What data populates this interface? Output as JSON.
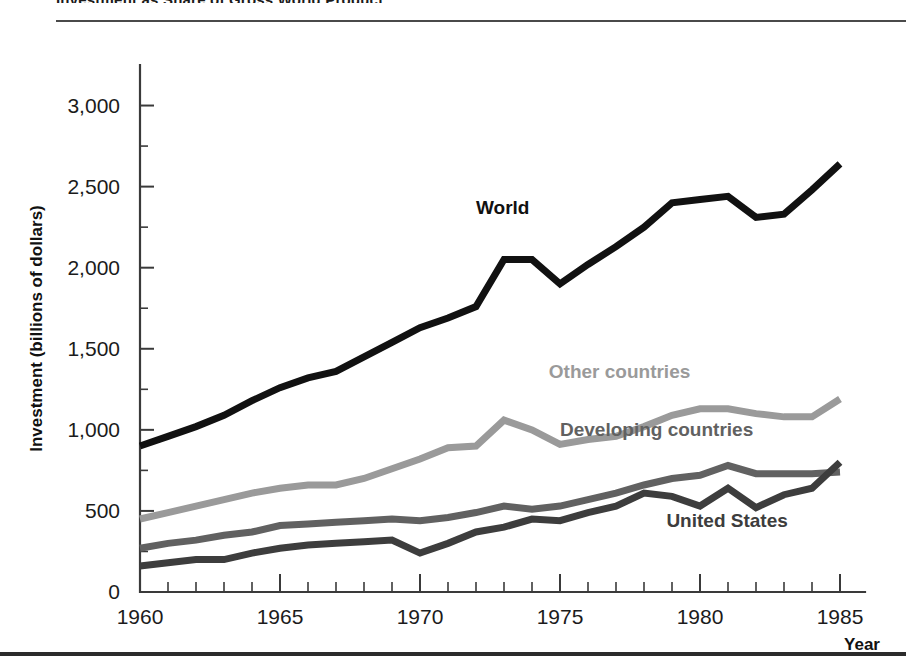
{
  "figure": {
    "title": "Investment as Share of Gross World Product",
    "top_rule": "horizontal-rule",
    "bottom_rule": "horizontal-rule"
  },
  "chart_data": {
    "type": "line",
    "title": "Investment as Share of Gross World Product",
    "xlabel": "Year",
    "ylabel": "Investment (billions of dollars)",
    "xlim": [
      1960,
      1985
    ],
    "ylim": [
      0,
      3250
    ],
    "grid": false,
    "legend_position": "inline-labels",
    "x_ticks": [
      1960,
      1965,
      1970,
      1975,
      1980,
      1985
    ],
    "x_tick_labels": [
      "1960",
      "1965",
      "1970",
      "1975",
      "1980",
      "1985"
    ],
    "x_minor_tick_step": 1,
    "y_ticks": [
      0,
      500,
      1000,
      1500,
      2000,
      2500,
      3000
    ],
    "y_tick_labels": [
      "0",
      "500",
      "1,000",
      "1,500",
      "2,000",
      "2,500",
      "3,000"
    ],
    "x": [
      1960,
      1961,
      1962,
      1963,
      1964,
      1965,
      1966,
      1967,
      1968,
      1969,
      1970,
      1971,
      1972,
      1973,
      1974,
      1975,
      1976,
      1977,
      1978,
      1979,
      1980,
      1981,
      1982,
      1983,
      1984,
      1985
    ],
    "series": [
      {
        "name": "World",
        "color": "#111111",
        "stroke_width": 7,
        "label": "World",
        "label_x": 1972.0,
        "label_y": 2330,
        "values": [
          900,
          960,
          1020,
          1090,
          1180,
          1260,
          1320,
          1360,
          1450,
          1540,
          1630,
          1690,
          1760,
          2050,
          2050,
          1900,
          2020,
          2130,
          2250,
          2400,
          2420,
          2440,
          2310,
          2330,
          2480,
          2640
        ]
      },
      {
        "name": "Other countries",
        "color": "#9a9a9a",
        "stroke_width": 7,
        "label": "Other countries",
        "label_x": 1974.6,
        "label_y": 1320,
        "values": [
          450,
          490,
          530,
          570,
          610,
          640,
          660,
          660,
          700,
          760,
          820,
          890,
          900,
          1060,
          1000,
          910,
          940,
          960,
          1020,
          1090,
          1130,
          1130,
          1100,
          1080,
          1080,
          1190
        ]
      },
      {
        "name": "Developing countries",
        "color": "#616161",
        "stroke_width": 7,
        "label": "Developing countries",
        "label_x": 1975.0,
        "label_y": 960,
        "values": [
          270,
          300,
          320,
          350,
          370,
          410,
          420,
          430,
          440,
          450,
          440,
          460,
          490,
          530,
          510,
          530,
          570,
          610,
          660,
          700,
          720,
          780,
          730,
          730,
          730,
          740
        ]
      },
      {
        "name": "United States",
        "color": "#3d3d3d",
        "stroke_width": 7,
        "label": "United States",
        "label_x": 1978.8,
        "label_y": 400,
        "values": [
          160,
          180,
          200,
          200,
          240,
          270,
          290,
          300,
          310,
          320,
          240,
          300,
          370,
          400,
          450,
          440,
          490,
          530,
          610,
          590,
          530,
          640,
          520,
          600,
          640,
          800
        ]
      }
    ]
  }
}
